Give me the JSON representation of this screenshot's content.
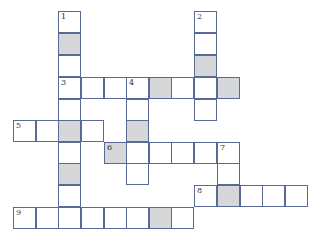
{
  "puzzle": {
    "type": "crossword",
    "border_color": "#5a6a96",
    "shaded_color": "#d5d7d9",
    "grid": {
      "col_x": [
        13,
        36,
        58,
        81,
        104,
        126,
        149,
        171,
        194,
        217,
        240,
        262,
        285
      ],
      "row_y": [
        11,
        33,
        55,
        77,
        99,
        120,
        142,
        163,
        185,
        207
      ],
      "cell_w": 23,
      "cell_h": 22
    },
    "cells": [
      {
        "r": 0,
        "c": 2,
        "num": "1"
      },
      {
        "r": 1,
        "c": 2,
        "shaded": true
      },
      {
        "r": 2,
        "c": 2
      },
      {
        "r": 3,
        "c": 2,
        "num": "3"
      },
      {
        "r": 4,
        "c": 2
      },
      {
        "r": 5,
        "c": 2,
        "shaded": true
      },
      {
        "r": 6,
        "c": 2
      },
      {
        "r": 7,
        "c": 2,
        "shaded": true
      },
      {
        "r": 8,
        "c": 2
      },
      {
        "r": 9,
        "c": 2
      },
      {
        "r": 0,
        "c": 8,
        "num": "2"
      },
      {
        "r": 1,
        "c": 8
      },
      {
        "r": 2,
        "c": 8,
        "shaded": true
      },
      {
        "r": 3,
        "c": 8
      },
      {
        "r": 4,
        "c": 8
      },
      {
        "r": 3,
        "c": 3
      },
      {
        "r": 3,
        "c": 4
      },
      {
        "r": 3,
        "c": 5,
        "num": "4"
      },
      {
        "r": 3,
        "c": 6,
        "shaded": true
      },
      {
        "r": 3,
        "c": 7
      },
      {
        "r": 3,
        "c": 9,
        "shaded": true
      },
      {
        "r": 4,
        "c": 5
      },
      {
        "r": 5,
        "c": 5,
        "shaded": true
      },
      {
        "r": 6,
        "c": 5
      },
      {
        "r": 7,
        "c": 5
      },
      {
        "r": 5,
        "c": 0,
        "num": "5"
      },
      {
        "r": 5,
        "c": 1
      },
      {
        "r": 5,
        "c": 3
      },
      {
        "r": 6,
        "c": 4,
        "num": "6",
        "shaded": true
      },
      {
        "r": 6,
        "c": 6
      },
      {
        "r": 6,
        "c": 7
      },
      {
        "r": 6,
        "c": 8
      },
      {
        "r": 6,
        "c": 9,
        "num": "7"
      },
      {
        "r": 7,
        "c": 9
      },
      {
        "r": 8,
        "c": 8,
        "num": "8"
      },
      {
        "r": 8,
        "c": 9,
        "shaded": true
      },
      {
        "r": 8,
        "c": 10
      },
      {
        "r": 8,
        "c": 11
      },
      {
        "r": 8,
        "c": 12
      },
      {
        "r": 9,
        "c": 0,
        "num": "9"
      },
      {
        "r": 9,
        "c": 1
      },
      {
        "r": 9,
        "c": 3
      },
      {
        "r": 9,
        "c": 4
      },
      {
        "r": 9,
        "c": 5
      },
      {
        "r": 9,
        "c": 6,
        "shaded": true
      },
      {
        "r": 9,
        "c": 7
      }
    ],
    "clues": {
      "across": [
        "3",
        "5",
        "6",
        "8",
        "9"
      ],
      "down": [
        "1",
        "2",
        "4",
        "7"
      ]
    }
  }
}
